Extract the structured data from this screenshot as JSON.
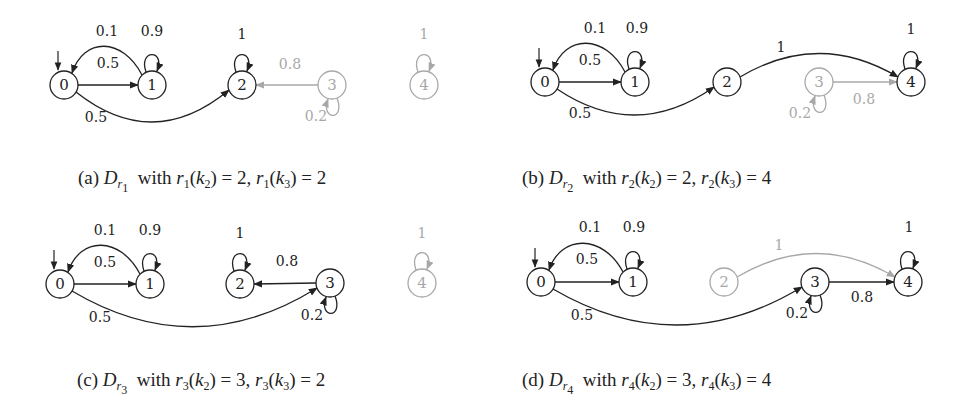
{
  "figure": {
    "colors": {
      "active": "#222222",
      "inactive": "#a8a8a8",
      "background": "#ffffff"
    },
    "panels": [
      {
        "id": "a",
        "label": "(a)",
        "distribution": "D",
        "sub": "r",
        "subsub": "1",
        "caption_rest": [
          [
            "r",
            "1",
            "2",
            "2"
          ],
          [
            "r",
            "1",
            "3",
            "2"
          ]
        ],
        "caption_text": "(a) D_{r1} with r1(k2) = 2, r1(k3) = 2",
        "caption_pos": [
          78,
          167
        ],
        "nodes": [
          {
            "id": "0",
            "x": 64,
            "y": 85,
            "active": true,
            "initial": true
          },
          {
            "id": "1",
            "x": 152,
            "y": 85,
            "active": true
          },
          {
            "id": "2",
            "x": 242,
            "y": 85,
            "active": true
          },
          {
            "id": "3",
            "x": 332,
            "y": 85,
            "active": false
          },
          {
            "id": "4",
            "x": 424,
            "y": 85,
            "active": false
          }
        ],
        "edges": [
          {
            "from": "0",
            "to": "1",
            "label": "0.5",
            "type": "straight",
            "active": true,
            "lx": 108,
            "ly": 68
          },
          {
            "from": "1",
            "to": "0",
            "label": "0.1",
            "type": "arc-up",
            "active": true,
            "lx": 107,
            "ly": 36
          },
          {
            "from": "1",
            "to": "1",
            "label": "0.9",
            "type": "loop-top",
            "active": true,
            "lx": 152,
            "ly": 36
          },
          {
            "from": "0",
            "to": "2",
            "label": "0.5",
            "type": "arc-down",
            "active": true,
            "lx": 96,
            "ly": 122,
            "curve": 34
          },
          {
            "from": "2",
            "to": "2",
            "label": "1",
            "type": "loop-top",
            "active": true,
            "lx": 242,
            "ly": 39
          },
          {
            "from": "3",
            "to": "2",
            "label": "0.8",
            "type": "straight",
            "active": false,
            "lx": 290,
            "ly": 69
          },
          {
            "from": "3",
            "to": "3",
            "label": "0.2",
            "type": "loop-bottom",
            "active": false,
            "lx": 316,
            "ly": 121
          },
          {
            "from": "4",
            "to": "4",
            "label": "1",
            "type": "loop-top",
            "active": false,
            "lx": 424,
            "ly": 39
          }
        ]
      },
      {
        "id": "b",
        "label": "(b)",
        "caption_text": "(b) D_{r2} with r2(k2) = 2, r2(k3) = 4",
        "caption_pos": [
          522,
          167
        ],
        "nodes": [
          {
            "id": "0",
            "x": 545,
            "y": 82,
            "active": true,
            "initial": true
          },
          {
            "id": "1",
            "x": 635,
            "y": 82,
            "active": true
          },
          {
            "id": "2",
            "x": 727,
            "y": 82,
            "active": true
          },
          {
            "id": "3",
            "x": 819,
            "y": 82,
            "active": false
          },
          {
            "id": "4",
            "x": 911,
            "y": 82,
            "active": true
          }
        ],
        "edges": [
          {
            "from": "0",
            "to": "1",
            "label": "0.5",
            "type": "straight",
            "active": true,
            "lx": 590,
            "ly": 65
          },
          {
            "from": "1",
            "to": "0",
            "label": "0.1",
            "type": "arc-up",
            "active": true,
            "lx": 595,
            "ly": 33
          },
          {
            "from": "1",
            "to": "1",
            "label": "0.9",
            "type": "loop-top",
            "active": true,
            "lx": 637,
            "ly": 33
          },
          {
            "from": "0",
            "to": "2",
            "label": "0.5",
            "type": "arc-down",
            "active": true,
            "lx": 580,
            "ly": 118,
            "curve": 30
          },
          {
            "from": "2",
            "to": "4",
            "label": "1",
            "type": "arc-up-long",
            "active": true,
            "lx": 781,
            "ly": 52,
            "curve": -36
          },
          {
            "from": "3",
            "to": "4",
            "label": "0.8",
            "type": "straight",
            "active": false,
            "lx": 864,
            "ly": 104
          },
          {
            "from": "3",
            "to": "3",
            "label": "0.2",
            "type": "loop-bottom",
            "active": false,
            "lx": 800,
            "ly": 118
          },
          {
            "from": "4",
            "to": "4",
            "label": "1",
            "type": "loop-top",
            "active": true,
            "lx": 911,
            "ly": 34
          }
        ]
      },
      {
        "id": "c",
        "label": "(c)",
        "caption_text": "(c) D_{r3} with r3(k2) = 3, r3(k3) = 2",
        "caption_pos": [
          77,
          369
        ],
        "nodes": [
          {
            "id": "0",
            "x": 60,
            "y": 284,
            "active": true,
            "initial": true
          },
          {
            "id": "1",
            "x": 150,
            "y": 284,
            "active": true
          },
          {
            "id": "2",
            "x": 240,
            "y": 284,
            "active": true
          },
          {
            "id": "3",
            "x": 330,
            "y": 283,
            "active": true
          },
          {
            "id": "4",
            "x": 422,
            "y": 283,
            "active": false
          }
        ],
        "edges": [
          {
            "from": "0",
            "to": "1",
            "label": "0.5",
            "type": "straight",
            "active": true,
            "lx": 105,
            "ly": 267
          },
          {
            "from": "1",
            "to": "0",
            "label": "0.1",
            "type": "arc-up",
            "active": true,
            "lx": 105,
            "ly": 235
          },
          {
            "from": "1",
            "to": "1",
            "label": "0.9",
            "type": "loop-top",
            "active": true,
            "lx": 150,
            "ly": 235
          },
          {
            "from": "0",
            "to": "3",
            "label": "0.5",
            "type": "arc-down",
            "active": true,
            "lx": 100,
            "ly": 322,
            "curve": 40
          },
          {
            "from": "2",
            "to": "2",
            "label": "1",
            "type": "loop-top",
            "active": true,
            "lx": 240,
            "ly": 238
          },
          {
            "from": "3",
            "to": "2",
            "label": "0.8",
            "type": "straight",
            "active": true,
            "lx": 287,
            "ly": 266
          },
          {
            "from": "3",
            "to": "3",
            "label": "0.2",
            "type": "loop-bottom",
            "active": true,
            "lx": 312,
            "ly": 320
          },
          {
            "from": "4",
            "to": "4",
            "label": "1",
            "type": "loop-top",
            "active": false,
            "lx": 422,
            "ly": 238
          }
        ]
      },
      {
        "id": "d",
        "label": "(d)",
        "caption_text": "(d) D_{r4} with r4(k2) = 3, r4(k3) = 4",
        "caption_pos": [
          522,
          369
        ],
        "nodes": [
          {
            "id": "0",
            "x": 541,
            "y": 282,
            "active": true,
            "initial": true
          },
          {
            "id": "1",
            "x": 633,
            "y": 282,
            "active": true
          },
          {
            "id": "2",
            "x": 724,
            "y": 282,
            "active": false
          },
          {
            "id": "3",
            "x": 815,
            "y": 282,
            "active": true
          },
          {
            "id": "4",
            "x": 908,
            "y": 282,
            "active": true
          }
        ],
        "edges": [
          {
            "from": "0",
            "to": "1",
            "label": "0.5",
            "type": "straight",
            "active": true,
            "lx": 587,
            "ly": 264
          },
          {
            "from": "1",
            "to": "0",
            "label": "0.1",
            "type": "arc-up",
            "active": true,
            "lx": 590,
            "ly": 232
          },
          {
            "from": "1",
            "to": "1",
            "label": "0.9",
            "type": "loop-top",
            "active": true,
            "lx": 634,
            "ly": 232
          },
          {
            "from": "0",
            "to": "3",
            "label": "0.5",
            "type": "arc-down",
            "active": true,
            "lx": 582,
            "ly": 320,
            "curve": 40
          },
          {
            "from": "2",
            "to": "4",
            "label": "1",
            "type": "arc-up-long",
            "active": false,
            "lx": 779,
            "ly": 250,
            "curve": -36
          },
          {
            "from": "3",
            "to": "4",
            "label": "0.8",
            "type": "straight",
            "active": true,
            "lx": 862,
            "ly": 302
          },
          {
            "from": "3",
            "to": "3",
            "label": "0.2",
            "type": "loop-bottom",
            "active": true,
            "lx": 797,
            "ly": 318
          },
          {
            "from": "4",
            "to": "4",
            "label": "1",
            "type": "loop-top",
            "active": true,
            "lx": 909,
            "ly": 232
          }
        ]
      }
    ],
    "captions": {
      "a": {
        "prefix": "(a)",
        "D": "D",
        "r": "r",
        "idx": "1",
        "with": "with",
        "k1": "k",
        "k1i": "2",
        "v1": "2",
        "k2": "k",
        "k2i": "3",
        "v2": "2"
      },
      "b": {
        "prefix": "(b)",
        "D": "D",
        "r": "r",
        "idx": "2",
        "with": "with",
        "k1": "k",
        "k1i": "2",
        "v1": "2",
        "k2": "k",
        "k2i": "3",
        "v2": "4"
      },
      "c": {
        "prefix": "(c)",
        "D": "D",
        "r": "r",
        "idx": "3",
        "with": "with",
        "k1": "k",
        "k1i": "2",
        "v1": "3",
        "k2": "k",
        "k2i": "3",
        "v2": "2"
      },
      "d": {
        "prefix": "(d)",
        "D": "D",
        "r": "r",
        "idx": "4",
        "with": "with",
        "k1": "k",
        "k1i": "2",
        "v1": "3",
        "k2": "k",
        "k2i": "3",
        "v2": "4"
      }
    }
  }
}
